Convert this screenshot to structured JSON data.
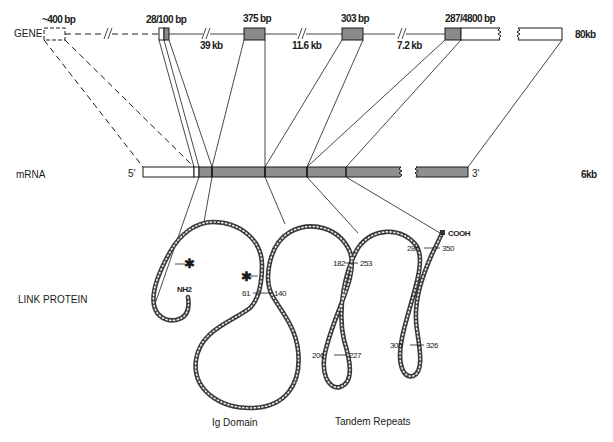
{
  "gene": {
    "row_label": "GENE",
    "size_label": "80kb",
    "exons": [
      {
        "label": "~400 bp",
        "type": "utr-dashed"
      },
      {
        "label": "28/100 bp",
        "type": "mixed"
      },
      {
        "label": "375 bp",
        "type": "coding"
      },
      {
        "label": "303 bp",
        "type": "coding"
      },
      {
        "label": "287/4800 bp",
        "type": "coding-utr"
      }
    ],
    "introns": [
      "39 kb",
      "11.6 kb",
      "7.2 kb"
    ]
  },
  "mrna": {
    "row_label": "mRNA",
    "five_prime": "5'",
    "three_prime": "3'",
    "size_label": "6kb"
  },
  "protein": {
    "row_label": "LINK PROTEIN",
    "n_terminus": "NH2",
    "c_terminus": "COOH",
    "residue_markers": [
      "61",
      "140",
      "182",
      "253",
      "206",
      "227",
      "280",
      "350",
      "305",
      "326"
    ],
    "domains": [
      "Ig Domain",
      "Tandem Repeats"
    ]
  },
  "colors": {
    "exon_fill": "#8a8a8a",
    "line": "#1a1a1a",
    "background": "#ffffff"
  }
}
